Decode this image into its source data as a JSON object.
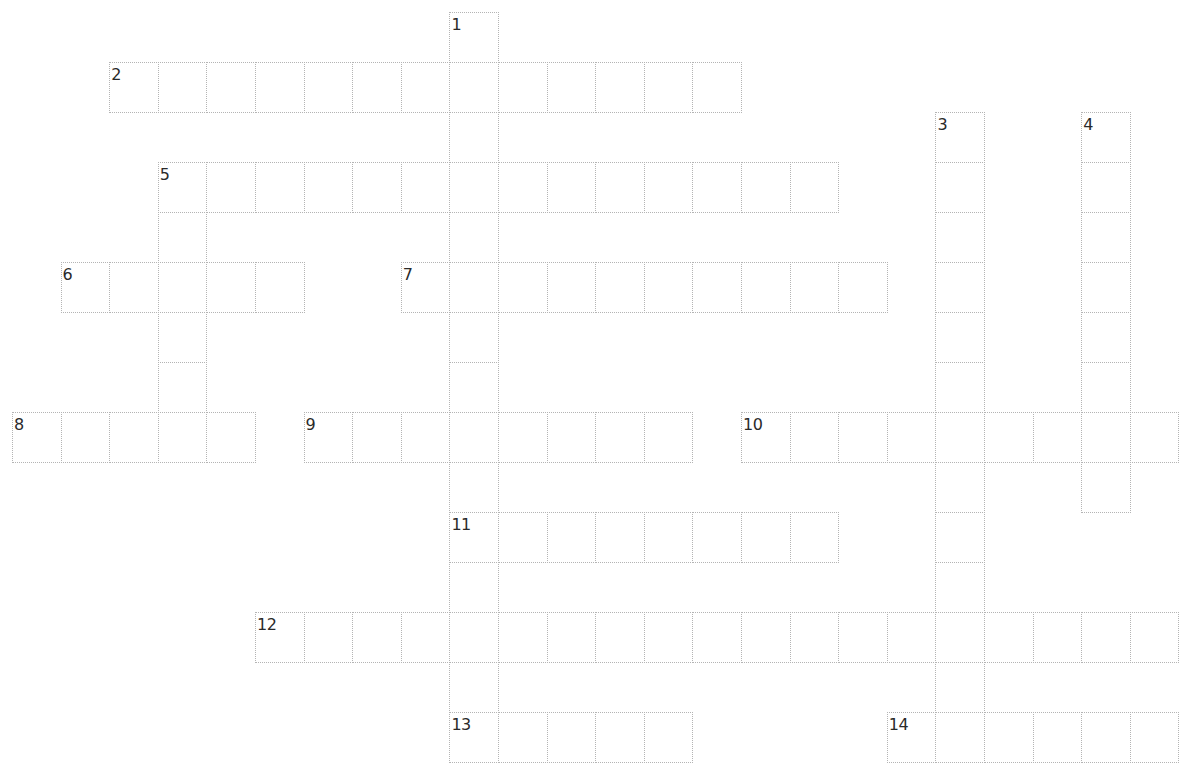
{
  "puzzle": {
    "grid": {
      "origin_x": 12,
      "origin_y": 12,
      "cell_w": 48.6,
      "cell_h": 50.0,
      "border_color": "#b4b4b4",
      "number_color": "#2a2a2a"
    },
    "entries": [
      {
        "number": "1",
        "direction": "down",
        "row": 0,
        "col": 9,
        "length": 15
      },
      {
        "number": "2",
        "direction": "across",
        "row": 1,
        "col": 2,
        "length": 13
      },
      {
        "number": "3",
        "direction": "down",
        "row": 2,
        "col": 19,
        "length": 13
      },
      {
        "number": "4",
        "direction": "down",
        "row": 2,
        "col": 22,
        "length": 8
      },
      {
        "number": "5",
        "direction": "across",
        "row": 3,
        "col": 3,
        "length": 14
      },
      {
        "number": "5",
        "direction": "down",
        "row": 3,
        "col": 3,
        "length": 6
      },
      {
        "number": "6",
        "direction": "across",
        "row": 5,
        "col": 1,
        "length": 5
      },
      {
        "number": "7",
        "direction": "across",
        "row": 5,
        "col": 8,
        "length": 10
      },
      {
        "number": "8",
        "direction": "across",
        "row": 8,
        "col": 0,
        "length": 5
      },
      {
        "number": "9",
        "direction": "across",
        "row": 8,
        "col": 6,
        "length": 8
      },
      {
        "number": "10",
        "direction": "across",
        "row": 8,
        "col": 15,
        "length": 9
      },
      {
        "number": "11",
        "direction": "across",
        "row": 10,
        "col": 9,
        "length": 8
      },
      {
        "number": "12",
        "direction": "across",
        "row": 12,
        "col": 5,
        "length": 19
      },
      {
        "number": "13",
        "direction": "across",
        "row": 14,
        "col": 9,
        "length": 5
      },
      {
        "number": "14",
        "direction": "across",
        "row": 14,
        "col": 18,
        "length": 6
      }
    ]
  }
}
